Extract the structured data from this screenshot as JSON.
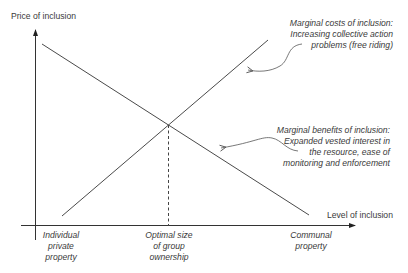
{
  "diagram": {
    "title": "",
    "y_axis_label": "Price of inclusion",
    "x_axis_label": "Level of inclusion",
    "x_ticks": [
      {
        "lines": [
          "Individual",
          "private",
          "property"
        ]
      },
      {
        "lines": [
          "Optimal size",
          "of group",
          "ownership"
        ]
      },
      {
        "lines": [
          "Communal",
          "property"
        ]
      }
    ],
    "curves": [
      {
        "name": "Marginal benefits of inclusion",
        "direction": "decreasing"
      },
      {
        "name": "Marginal costs of inclusion",
        "direction": "increasing"
      }
    ],
    "annotations": {
      "costs": {
        "lines": [
          "Marginal costs of inclusion:",
          "Increasing collective action",
          "problems (free riding)"
        ]
      },
      "benefits": {
        "lines": [
          "Marginal benefits of inclusion:",
          "Expanded vested interest in",
          "the resource, ease of",
          "monitoring and enforcement"
        ]
      }
    },
    "intersection_label": "Optimal size of group ownership",
    "colors": {
      "line": "#4a4a4a",
      "text": "#3a3a3a",
      "background": "#ffffff"
    }
  }
}
